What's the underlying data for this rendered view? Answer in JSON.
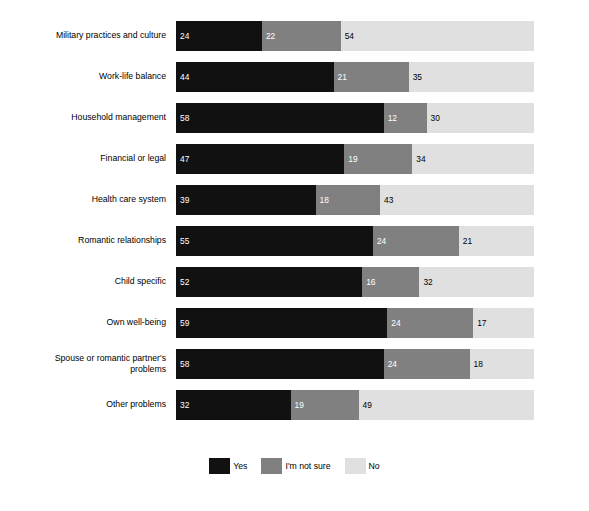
{
  "chart_data": {
    "type": "bar",
    "subtype": "stacked-horizontal-100pct",
    "title": "",
    "subtitle": "",
    "xlabel": "",
    "ylabel": "",
    "xlim": [
      0,
      100
    ],
    "grid": false,
    "legend_position": "bottom-center",
    "categories": [
      "Military practices and culture",
      "Work-life balance",
      "Household management",
      "Financial or legal",
      "Health care system",
      "Romantic relationships",
      "Child specific",
      "Own well-being",
      "Spouse or romantic partner's\nproblems",
      "Other problems"
    ],
    "series": [
      {
        "name": "Yes",
        "color": "#111111",
        "label_color": "#ffffff",
        "values": [
          24,
          44,
          58,
          47,
          39,
          55,
          52,
          59,
          58,
          32
        ]
      },
      {
        "name": "I'm not sure",
        "color": "#808080",
        "label_color": "#ffffff",
        "values": [
          22,
          21,
          12,
          19,
          18,
          24,
          16,
          24,
          24,
          19
        ]
      },
      {
        "name": "No",
        "color": "#e0e0e0",
        "label_color": "#000000",
        "values": [
          54,
          35,
          30,
          34,
          43,
          21,
          32,
          17,
          18,
          49
        ]
      }
    ],
    "rows": [
      {
        "category": "Military practices and culture",
        "yes": 24,
        "not_sure": 22,
        "no": 54
      },
      {
        "category": "Work-life balance",
        "yes": 44,
        "not_sure": 21,
        "no": 35
      },
      {
        "category": "Household management",
        "yes": 58,
        "not_sure": 12,
        "no": 30
      },
      {
        "category": "Financial or legal",
        "yes": 47,
        "not_sure": 19,
        "no": 34
      },
      {
        "category": "Health care system",
        "yes": 39,
        "not_sure": 18,
        "no": 43
      },
      {
        "category": "Romantic relationships",
        "yes": 55,
        "not_sure": 24,
        "no": 21
      },
      {
        "category": "Child specific",
        "yes": 52,
        "not_sure": 16,
        "no": 32
      },
      {
        "category": "Own well-being",
        "yes": 59,
        "not_sure": 24,
        "no": 17
      },
      {
        "category": "Spouse or romantic partner's\nproblems",
        "yes": 58,
        "not_sure": 24,
        "no": 18
      },
      {
        "category": "Other problems",
        "yes": 32,
        "not_sure": 19,
        "no": 49
      }
    ],
    "legend": [
      {
        "label": "Yes",
        "color": "#111111"
      },
      {
        "label": "I'm not sure",
        "color": "#808080"
      },
      {
        "label": "No",
        "color": "#e0e0e0"
      }
    ]
  }
}
